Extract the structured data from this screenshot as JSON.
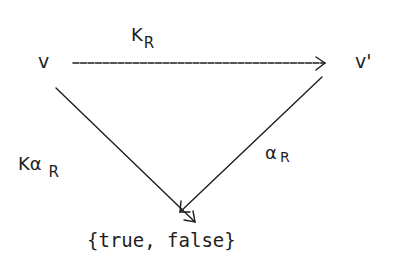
{
  "diagram": {
    "type": "commutative-triangle",
    "nodes": {
      "source": "v",
      "target": "v'",
      "result": "{true, false}"
    },
    "edges": {
      "top": {
        "from": "v",
        "to": "v'",
        "label_main": "K",
        "label_sub": "R"
      },
      "left": {
        "from": "v",
        "to": "{true, false}",
        "label_main": "Kα",
        "label_sub": "R"
      },
      "right": {
        "from": "v'",
        "to": "{true, false}",
        "label_main": "α",
        "label_sub": "R"
      }
    },
    "colors": {
      "ink": "#1e1e1e",
      "background": "#ffffff"
    }
  }
}
